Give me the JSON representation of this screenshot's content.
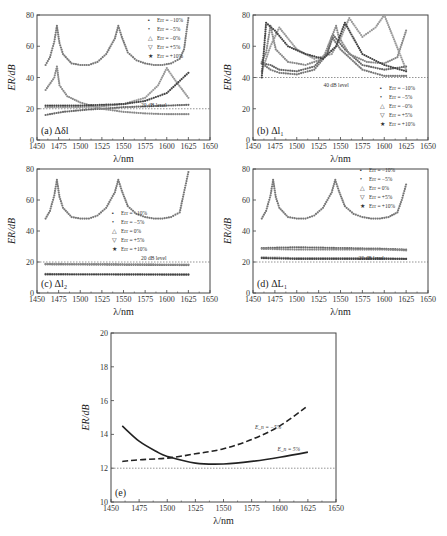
{
  "chart_data": [
    {
      "id": "a",
      "type": "scatter",
      "panel_label": "(a) Δδl",
      "xlabel": "λ/nm",
      "ylabel": "ER/dB",
      "xlim": [
        1450,
        1650
      ],
      "ylim": [
        0,
        80
      ],
      "xticks": [
        1450,
        1475,
        1500,
        1525,
        1550,
        1575,
        1600,
        1625,
        1650
      ],
      "yticks": [
        0,
        20,
        40,
        60,
        80
      ],
      "reference_line": {
        "y": 20,
        "label": "20 dB level"
      },
      "legend": [
        "Err = −10%",
        "Err = −5%",
        "Err = −0%",
        "Err = +5%",
        "Err = +10%"
      ],
      "legend_position": "upper right",
      "series": [
        {
          "name": "Err = 0%",
          "x": [
            1460,
            1465,
            1470,
            1473,
            1476,
            1480,
            1490,
            1500,
            1510,
            1520,
            1530,
            1540,
            1544,
            1548,
            1555,
            1565,
            1575,
            1585,
            1595,
            1605,
            1615,
            1620,
            1625
          ],
          "y": [
            48,
            53,
            63,
            73,
            62,
            55,
            49,
            48,
            48,
            50,
            55,
            65,
            73,
            66,
            56,
            51,
            49,
            48,
            48,
            49,
            52,
            58,
            78
          ]
        },
        {
          "name": "Err = -10%",
          "x": [
            1460,
            1470,
            1480,
            1490,
            1500,
            1510,
            1525,
            1550,
            1575,
            1600,
            1625
          ],
          "y": [
            16,
            17,
            18,
            18.5,
            19,
            19.5,
            20,
            21,
            21.5,
            22,
            22.5
          ]
        },
        {
          "name": "Err = -5%",
          "x": [
            1460,
            1470,
            1473,
            1476,
            1485,
            1500,
            1525,
            1550,
            1575,
            1600,
            1625
          ],
          "y": [
            32,
            40,
            47,
            35,
            28,
            24,
            20,
            18,
            17,
            16.5,
            16.5
          ]
        },
        {
          "name": "Err = +5%",
          "x": [
            1460,
            1500,
            1525,
            1550,
            1575,
            1590,
            1600,
            1610,
            1625
          ],
          "y": [
            21,
            21,
            21.5,
            23,
            27,
            35,
            46,
            38,
            27
          ]
        },
        {
          "name": "Err = +10%",
          "x": [
            1460,
            1475,
            1500,
            1525,
            1550,
            1575,
            1600,
            1625
          ],
          "y": [
            22,
            22,
            22,
            22.5,
            23,
            25,
            30,
            43
          ]
        }
      ]
    },
    {
      "id": "b",
      "type": "scatter",
      "panel_label": "(b) Δl₁",
      "xlabel": "λ/nm",
      "ylabel": "ER/dB",
      "xlim": [
        1450,
        1650
      ],
      "ylim": [
        0,
        80
      ],
      "xticks": [
        1450,
        1475,
        1500,
        1525,
        1550,
        1575,
        1600,
        1625,
        1650
      ],
      "yticks": [
        0,
        20,
        40,
        60,
        80
      ],
      "reference_line": {
        "y": 40,
        "label": "40 dB level"
      },
      "legend": [
        "Err = −10%",
        "Err = −5%",
        "Err = −0%",
        "Err = +5%",
        "Err = +10%"
      ],
      "legend_position": "lower right",
      "series": [
        {
          "name": "Err = -10%",
          "x": [
            1460,
            1470,
            1480,
            1500,
            1520,
            1535,
            1540,
            1550,
            1575,
            1600,
            1625
          ],
          "y": [
            49,
            45,
            43,
            42,
            45,
            55,
            66,
            58,
            45,
            41,
            41
          ]
        },
        {
          "name": "Err = -5%",
          "x": [
            1460,
            1470,
            1480,
            1500,
            1520,
            1535,
            1542,
            1555,
            1575,
            1600,
            1625
          ],
          "y": [
            49,
            48,
            45,
            44,
            47,
            56,
            67,
            58,
            48,
            45,
            47
          ]
        },
        {
          "name": "Err = 0%",
          "x": [
            1460,
            1465,
            1470,
            1476,
            1490,
            1510,
            1530,
            1545,
            1548,
            1560,
            1580,
            1600,
            1615,
            1625
          ],
          "y": [
            50,
            56,
            73,
            58,
            50,
            48,
            52,
            73,
            66,
            55,
            50,
            49,
            53,
            70
          ]
        },
        {
          "name": "Err = +5%",
          "x": [
            1460,
            1470,
            1480,
            1500,
            1520,
            1540,
            1550,
            1560,
            1575,
            1590,
            1600,
            1625
          ],
          "y": [
            44,
            60,
            72,
            58,
            52,
            55,
            65,
            78,
            66,
            72,
            80,
            45
          ]
        },
        {
          "name": "Err = +10%",
          "x": [
            1460,
            1465,
            1475,
            1490,
            1510,
            1530,
            1545,
            1555,
            1575,
            1600,
            1625
          ],
          "y": [
            40,
            75,
            70,
            60,
            55,
            52,
            60,
            75,
            55,
            48,
            44
          ]
        }
      ]
    },
    {
      "id": "c",
      "type": "scatter",
      "panel_label": "(c) Δl₂",
      "xlabel": "λ/nm",
      "ylabel": "ER/dB",
      "xlim": [
        1450,
        1650
      ],
      "ylim": [
        0,
        80
      ],
      "xticks": [
        1450,
        1475,
        1500,
        1525,
        1550,
        1575,
        1600,
        1625,
        1650
      ],
      "yticks": [
        0,
        20,
        40,
        60,
        80
      ],
      "reference_line": {
        "y": 20,
        "label": "20 dB level"
      },
      "legend": [
        "Err = −10%",
        "Err = −5%",
        "Err = 0%",
        "Err = +5%",
        "Err = +10%"
      ],
      "legend_position": "center",
      "series": [
        {
          "name": "Err = 0%",
          "x": [
            1460,
            1465,
            1470,
            1473,
            1476,
            1480,
            1490,
            1500,
            1510,
            1520,
            1530,
            1540,
            1544,
            1548,
            1555,
            1565,
            1575,
            1585,
            1595,
            1605,
            1615,
            1620,
            1625
          ],
          "y": [
            48,
            53,
            63,
            73,
            62,
            55,
            49,
            48,
            48,
            50,
            55,
            65,
            73,
            66,
            56,
            51,
            49,
            48,
            48,
            49,
            52,
            65,
            78
          ]
        },
        {
          "name": "Err = -10%",
          "x": [
            1460,
            1625
          ],
          "y": [
            18.5,
            18
          ]
        },
        {
          "name": "Err = -5%",
          "x": [
            1460,
            1625
          ],
          "y": [
            18.8,
            18.3
          ]
        },
        {
          "name": "Err = +5%",
          "x": [
            1460,
            1625
          ],
          "y": [
            12.3,
            12
          ]
        },
        {
          "name": "Err = +10%",
          "x": [
            1460,
            1625
          ],
          "y": [
            12,
            11.8
          ]
        }
      ]
    },
    {
      "id": "d",
      "type": "scatter",
      "panel_label": "(d) ΔL₁",
      "xlabel": "λ/nm",
      "ylabel": "ER/dB",
      "xlim": [
        1450,
        1650
      ],
      "ylim": [
        0,
        80
      ],
      "xticks": [
        1450,
        1475,
        1500,
        1525,
        1550,
        1575,
        1600,
        1625,
        1650
      ],
      "yticks": [
        0,
        20,
        40,
        60,
        80
      ],
      "reference_line": {
        "y": 20,
        "label": "20 dB level"
      },
      "legend": [
        "Err = −10%",
        "Err = −5%",
        "Err = 0%",
        "Err = +5%",
        "Err = +10%"
      ],
      "legend_position": "upper right",
      "series": [
        {
          "name": "Err = 0%",
          "x": [
            1460,
            1465,
            1470,
            1473,
            1476,
            1480,
            1490,
            1500,
            1510,
            1520,
            1530,
            1540,
            1544,
            1548,
            1555,
            1565,
            1575,
            1585,
            1595,
            1605,
            1615,
            1620,
            1625
          ],
          "y": [
            48,
            53,
            63,
            73,
            62,
            55,
            49,
            48,
            48,
            50,
            55,
            65,
            73,
            66,
            56,
            51,
            49,
            48,
            48,
            49,
            52,
            60,
            70
          ]
        },
        {
          "name": "Err = -10%",
          "x": [
            1460,
            1500,
            1550,
            1600,
            1625
          ],
          "y": [
            29,
            29.5,
            29,
            28.5,
            28
          ]
        },
        {
          "name": "Err = -5%",
          "x": [
            1460,
            1500,
            1550,
            1600,
            1625
          ],
          "y": [
            28.5,
            28,
            28,
            28,
            27.5
          ]
        },
        {
          "name": "Err = +5%",
          "x": [
            1460,
            1500,
            1550,
            1600,
            1625
          ],
          "y": [
            23,
            22.5,
            22.5,
            22.5,
            22
          ]
        },
        {
          "name": "Err = +10%",
          "x": [
            1460,
            1500,
            1550,
            1600,
            1625
          ],
          "y": [
            22.5,
            22,
            22,
            22,
            22
          ]
        }
      ]
    },
    {
      "id": "e",
      "type": "line",
      "panel_label": "(e)",
      "xlabel": "λ/nm",
      "ylabel": "ER/dB",
      "xlim": [
        1450,
        1650
      ],
      "ylim": [
        10,
        20
      ],
      "xticks": [
        1450,
        1475,
        1500,
        1525,
        1550,
        1575,
        1600,
        1625,
        1650
      ],
      "yticks": [
        10,
        12,
        14,
        16,
        18,
        20
      ],
      "reference_line": {
        "y": 12,
        "label": ""
      },
      "series": [
        {
          "name": "E_n = -5%",
          "style": "dashed",
          "x": [
            1460,
            1475,
            1500,
            1525,
            1550,
            1575,
            1600,
            1625
          ],
          "y": [
            12.4,
            12.5,
            12.6,
            12.85,
            13.15,
            13.7,
            14.5,
            15.7
          ]
        },
        {
          "name": "E_n = 5%",
          "style": "solid",
          "x": [
            1460,
            1475,
            1490,
            1500,
            1525,
            1550,
            1575,
            1600,
            1625
          ],
          "y": [
            14.5,
            13.6,
            13.0,
            12.7,
            12.3,
            12.25,
            12.4,
            12.65,
            12.95
          ]
        }
      ],
      "annotations": [
        {
          "text": "E_n = −5%",
          "x": 1578,
          "y": 14.3
        },
        {
          "text": "E_n = 5%",
          "x": 1598,
          "y": 13.0
        }
      ]
    }
  ],
  "labels": {
    "a": "(a) Δδl",
    "b_main": "(b) Δl",
    "b_sub": "1",
    "c_main": "(c) Δl",
    "c_sub": "2",
    "d_main": "(d) ΔL",
    "d_sub": "1",
    "e": "(e)",
    "xlabel": "λ/nm",
    "ylabel": "ER/dB",
    "level20": "20 dB level",
    "level40": "40 dB level",
    "ann_e1": "= −5%",
    "ann_e2": "= 5%",
    "ann_E": "E",
    "ann_sub": "n"
  },
  "legend_items": [
    "Err = −10%",
    "Err = −5%",
    "Err = −0%",
    "Err = +5%",
    "Err = +10%"
  ],
  "legend_items_cd": [
    "Err = −10%",
    "Err = −5%",
    "Err =  0%",
    "Err = +5%",
    "Err = +10%"
  ]
}
